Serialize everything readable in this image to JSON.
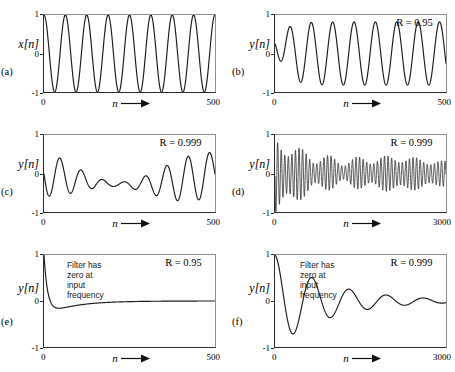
{
  "figure": {
    "axis_arrow": "⟶"
  },
  "chart_data": [
    {
      "id": "a",
      "type": "line",
      "panel_letter": "(a)",
      "ylabel": "x[n]",
      "xlabel": "n",
      "xlim": [
        0,
        500
      ],
      "ylim": [
        -1,
        1
      ],
      "yticks": [
        "1",
        "0",
        "-1"
      ],
      "xticks": [
        "0",
        "500"
      ],
      "annotation": "",
      "r_label": "",
      "title": "Input sinusoid x[n]",
      "description": "Pure sinusoid, constant unit amplitude, about 8 cycles over n = 0 to 500",
      "grid": false,
      "series": [
        {
          "name": "x[n]",
          "form": "cos",
          "amplitude": 1.0,
          "cycles": 8.0,
          "phase": 0.0,
          "envelope": "constant",
          "decay": 0.0
        }
      ]
    },
    {
      "id": "b",
      "type": "line",
      "panel_letter": "(b)",
      "ylabel": "y[n]",
      "xlabel": "n",
      "xlim": [
        0,
        500
      ],
      "ylim": [
        -1,
        1
      ],
      "yticks": [
        "1",
        "0",
        "-1"
      ],
      "xticks": [
        "0",
        "500"
      ],
      "annotation": "",
      "r_label": "R = 0.95",
      "r_value": 0.95,
      "title": "Resonator output, R = 0.95",
      "description": "Output rises from 0 and settles to steady state sinusoid of amplitude about 0.8 after a short transient",
      "grid": false,
      "series": [
        {
          "name": "y[n]",
          "form": "transient-sinusoid",
          "amplitude": 0.82,
          "cycles": 8.0,
          "phase": 1.9,
          "envelope": "rise",
          "rise_rate": 18.0
        }
      ]
    },
    {
      "id": "c",
      "type": "line",
      "panel_letter": "(c)",
      "ylabel": "y[n]",
      "xlabel": "n",
      "xlim": [
        0,
        500
      ],
      "ylim": [
        -1,
        1
      ],
      "yticks": [
        "1",
        "0",
        "-1"
      ],
      "xticks": [
        "0",
        "500"
      ],
      "annotation": "",
      "r_label": "R = 0.999",
      "r_value": 0.999,
      "title": "Resonator output, R = 0.999 over 500 samples",
      "description": "Beating waveform: sum of driven and natural response, slow envelope modulation, peaks near 1 and troughs near -1",
      "grid": false,
      "series": [
        {
          "name": "y[n]",
          "form": "beat",
          "amplitude": 0.6,
          "cycles": 8.0,
          "beat_cycles": 1.05,
          "phase": 1.6,
          "offset": -0.18
        }
      ]
    },
    {
      "id": "d",
      "type": "line",
      "panel_letter": "(d)",
      "ylabel": "y[n]",
      "xlabel": "n",
      "xlim": [
        0,
        3000
      ],
      "ylim": [
        -1,
        1
      ],
      "yticks": [
        "1",
        "0",
        "-1"
      ],
      "xticks": [
        "0",
        "3000"
      ],
      "annotation": "",
      "r_label": "R = 0.999",
      "r_value": 0.999,
      "title": "Resonator output, R = 0.999 over 3000 samples",
      "description": "Dense beating oscillation, roughly 48 cycles, amplitude modulated with slow beat envelope decaying toward steady state near amplitude 0.45",
      "grid": false,
      "series": [
        {
          "name": "y[n]",
          "form": "beat-dense",
          "amplitude": 0.5,
          "cycles": 48.0,
          "beat_cycles": 6.0,
          "phase": 1.6,
          "offset": -0.05
        }
      ]
    },
    {
      "id": "e",
      "type": "line",
      "panel_letter": "(e)",
      "ylabel": "y[n]",
      "xlabel": "n",
      "xlim": [
        0,
        500
      ],
      "ylim": [
        -1,
        1
      ],
      "yticks": [
        "1",
        "0",
        "-1"
      ],
      "xticks": [
        "0",
        "500"
      ],
      "annotation": "Filter has zero at\ninput frequency",
      "r_label": "R = 0.95",
      "r_value": 0.95,
      "title": "Notch filter output, R = 0.95",
      "description": "Starts at 1, drops sharply to about -0.18 near n = 55, then decays to zero steady state",
      "grid": false,
      "series": [
        {
          "name": "y[n]",
          "form": "notch-fast",
          "start": 1.0,
          "undershoot": -0.18,
          "undershoot_at": 0.11,
          "decay": 60.0
        }
      ]
    },
    {
      "id": "f",
      "type": "line",
      "panel_letter": "(f)",
      "ylabel": "y[n]",
      "xlabel": "n",
      "xlim": [
        0,
        3000
      ],
      "ylim": [
        -1,
        1
      ],
      "yticks": [
        "1",
        "0",
        "-1"
      ],
      "xticks": [
        "0",
        "3000"
      ],
      "annotation": "Filter has zero at\ninput frequency",
      "r_label": "R = 0.999",
      "r_value": 0.999,
      "title": "Notch filter output, R = 0.999",
      "description": "Starts at 1, damped oscillation with about 4.5 cycles decaying toward zero; first trough about -0.85, then 0.55, -0.42, 0.3, -0.18, 0.12",
      "grid": false,
      "series": [
        {
          "name": "y[n]",
          "form": "damped-sinusoid",
          "amplitude": 1.0,
          "cycles": 4.6,
          "phase": 0.0,
          "decay_tau": 0.32
        }
      ]
    }
  ]
}
